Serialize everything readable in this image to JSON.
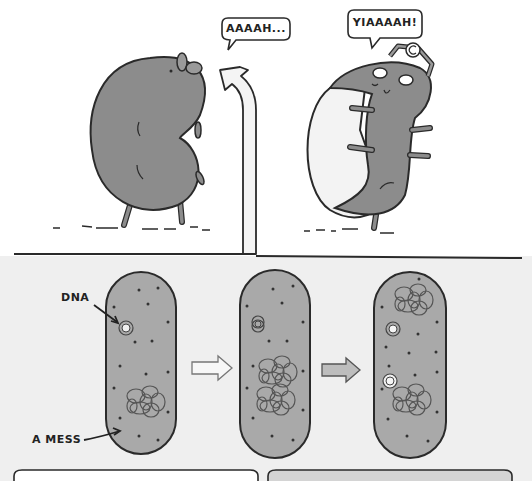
{
  "comic": {
    "top_panel": {
      "left_character": {
        "speech": "AAAAH...",
        "description": "gray kidney-shaped creature stretching upward"
      },
      "right_character": {
        "speech": "YIAAAAH!",
        "description": "gray creature splitting apart, wearing a headlamp"
      }
    },
    "bottom_panel": {
      "labels": {
        "dna": "DNA",
        "mess": "A MESS"
      },
      "cells": [
        {
          "name": "cell-original",
          "plasmids": 1,
          "tangles": 1
        },
        {
          "name": "cell-replicating",
          "plasmids": 1,
          "tangles": 2
        },
        {
          "name": "cell-dividing",
          "plasmids": 2,
          "tangles": 2
        }
      ],
      "arrows": [
        "outline-arrow",
        "gray-arrow"
      ]
    }
  },
  "colors": {
    "ink": "#2a2a2a",
    "cell_fill": "#a9a9a9",
    "creature_fill": "#8c8c8c",
    "bottom_bg": "#efefef",
    "top_bg": "#ffffff",
    "arrow_light": "#f4f4f4",
    "arrow_gray": "#bdbdbd"
  }
}
